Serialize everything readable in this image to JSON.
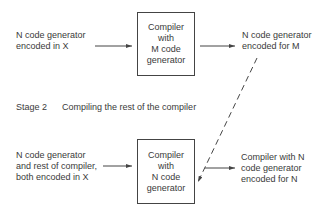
{
  "stage1": {
    "input_label_lines": [
      "N code generator",
      "encoded in X"
    ],
    "box_label": "Compiler\nwith\nM code\ngenerator",
    "output_label_lines": [
      "N code generator",
      "encoded for M"
    ]
  },
  "stage2": {
    "heading_number": "Stage 2",
    "heading_text": "Compiling the rest of the compiler",
    "input_label_lines": [
      "N code generator",
      "and rest of compiler,",
      "both encoded in X"
    ],
    "box_label": "Compiler\nwith\nN code\ngenerator",
    "output_label_lines": [
      "Compiler with N",
      "code generator",
      "encoded for N"
    ]
  },
  "colors": {
    "line": "#444444",
    "text": "#3a3a3a"
  }
}
